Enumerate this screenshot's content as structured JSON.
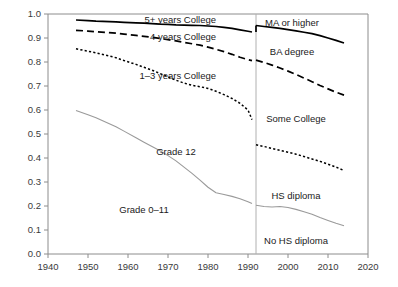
{
  "chart_data": {
    "type": "line",
    "title": "",
    "subtitle": "",
    "xlabel": "",
    "ylabel": "",
    "xlim": [
      1940,
      2020
    ],
    "ylim": [
      0.0,
      1.0
    ],
    "grid": false,
    "legend_position": "inline-annotations",
    "xticks": [
      "1940",
      "1950",
      "1960",
      "1970",
      "1980",
      "1990",
      "2000",
      "2010",
      "2020"
    ],
    "xtick_values": [
      1940,
      1950,
      1960,
      1970,
      1980,
      1990,
      2000,
      2010,
      2020
    ],
    "yticks": [
      "0.0",
      "0.1",
      "0.2",
      "0.3",
      "0.4",
      "0.5",
      "0.6",
      "0.7",
      "0.8",
      "0.9",
      "1.0"
    ],
    "ytick_values": [
      0.0,
      0.1,
      0.2,
      0.3,
      0.4,
      0.5,
      0.6,
      0.7,
      0.8,
      0.9,
      1.0
    ],
    "annotations": [
      {
        "text": "5+ years College",
        "x": 1982,
        "y": 0.975,
        "align": "end"
      },
      {
        "text": "4 years College",
        "x": 1982,
        "y": 0.905,
        "align": "end"
      },
      {
        "text": "1–3 years College",
        "x": 1982,
        "y": 0.745,
        "align": "end"
      },
      {
        "text": "Grade 12",
        "x": 1972,
        "y": 0.425,
        "align": "middle"
      },
      {
        "text": "Grade 0–11",
        "x": 1964,
        "y": 0.185,
        "align": "middle"
      },
      {
        "text": "MA or higher",
        "x": 2001,
        "y": 0.965,
        "align": "middle"
      },
      {
        "text": "BA degree",
        "x": 2001,
        "y": 0.845,
        "align": "middle"
      },
      {
        "text": "Some College",
        "x": 2002,
        "y": 0.565,
        "align": "middle"
      },
      {
        "text": "HS diploma",
        "x": 2002,
        "y": 0.245,
        "align": "middle"
      },
      {
        "text": "No HS diploma",
        "x": 2002,
        "y": 0.055,
        "align": "middle"
      }
    ],
    "reference_line": {
      "x": 1992,
      "label": ""
    },
    "series": [
      {
        "name": "5+ years College / MA or higher",
        "style": "solid",
        "color": "#000000",
        "x": [
          1947,
          1950,
          1952,
          1957,
          1959,
          1962,
          1964,
          1966,
          1968,
          1970,
          1972,
          1974,
          1976,
          1978,
          1980,
          1982,
          1984,
          1986,
          1988,
          1990,
          1991,
          1992,
          1994,
          1996,
          1998,
          2000,
          2002,
          2004,
          2006,
          2008,
          2010,
          2012,
          2014
        ],
        "y": [
          0.975,
          0.972,
          0.97,
          0.967,
          0.965,
          0.963,
          0.962,
          0.96,
          0.958,
          0.957,
          0.955,
          0.954,
          0.953,
          0.952,
          0.95,
          0.948,
          0.944,
          0.94,
          0.934,
          0.928,
          0.925,
          0.952,
          0.948,
          0.944,
          0.94,
          0.935,
          0.93,
          0.924,
          0.918,
          0.91,
          0.9,
          0.89,
          0.879
        ]
      },
      {
        "name": "4 years College / BA degree",
        "style": "dashed",
        "color": "#000000",
        "x": [
          1947,
          1950,
          1952,
          1957,
          1959,
          1962,
          1964,
          1966,
          1968,
          1970,
          1972,
          1974,
          1976,
          1978,
          1980,
          1982,
          1984,
          1986,
          1988,
          1990,
          1991,
          1992,
          1994,
          1996,
          1998,
          2000,
          2002,
          2004,
          2006,
          2008,
          2010,
          2012,
          2014
        ],
        "y": [
          0.932,
          0.929,
          0.926,
          0.92,
          0.916,
          0.911,
          0.907,
          0.903,
          0.898,
          0.893,
          0.888,
          0.882,
          0.876,
          0.87,
          0.862,
          0.853,
          0.843,
          0.832,
          0.82,
          0.81,
          0.806,
          0.808,
          0.798,
          0.787,
          0.775,
          0.762,
          0.748,
          0.733,
          0.718,
          0.702,
          0.688,
          0.674,
          0.662
        ]
      },
      {
        "name": "1–3 years College / Some College",
        "style": "dotted",
        "color": "#000000",
        "x": [
          1947,
          1950,
          1952,
          1957,
          1959,
          1962,
          1964,
          1966,
          1968,
          1970,
          1972,
          1974,
          1976,
          1978,
          1980,
          1982,
          1984,
          1986,
          1988,
          1990,
          1991,
          1992,
          1994,
          1996,
          1998,
          2000,
          2002,
          2004,
          2006,
          2008,
          2010,
          2012,
          2014
        ],
        "y": [
          0.855,
          0.845,
          0.838,
          0.818,
          0.806,
          0.79,
          0.778,
          0.766,
          0.752,
          0.738,
          0.724,
          0.712,
          0.703,
          0.697,
          0.69,
          0.678,
          0.664,
          0.648,
          0.628,
          0.6,
          0.56,
          0.455,
          0.448,
          0.44,
          0.432,
          0.424,
          0.416,
          0.406,
          0.396,
          0.386,
          0.374,
          0.362,
          0.348
        ]
      },
      {
        "name": "Grade 0–11 / No HS diploma",
        "style": "gray",
        "color": "#9a9a9a",
        "x": [
          1947,
          1950,
          1952,
          1957,
          1959,
          1962,
          1964,
          1966,
          1968,
          1970,
          1972,
          1974,
          1976,
          1978,
          1980,
          1982,
          1984,
          1986,
          1988,
          1990,
          1991,
          1992,
          1994,
          1996,
          1998,
          2000,
          2002,
          2004,
          2006,
          2008,
          2010,
          2012,
          2014
        ],
        "y": [
          0.598,
          0.58,
          0.568,
          0.53,
          0.512,
          0.484,
          0.466,
          0.448,
          0.43,
          0.41,
          0.388,
          0.362,
          0.336,
          0.308,
          0.278,
          0.255,
          0.248,
          0.24,
          0.23,
          0.218,
          0.21,
          0.203,
          0.198,
          0.196,
          0.198,
          0.194,
          0.186,
          0.176,
          0.166,
          0.152,
          0.14,
          0.128,
          0.118
        ]
      }
    ]
  }
}
